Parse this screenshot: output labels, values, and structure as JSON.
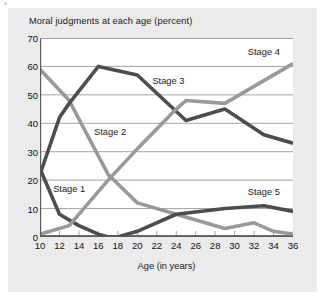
{
  "chart_data": {
    "type": "line",
    "title": "Moral judgments at each age (percent)",
    "xlabel": "Age (in years)",
    "ylabel": "",
    "xlim": [
      10,
      36
    ],
    "ylim": [
      0,
      70
    ],
    "grid": true,
    "legend_position": "inline-annotations",
    "xticks": [
      10,
      12,
      14,
      16,
      18,
      20,
      22,
      24,
      26,
      28,
      30,
      32,
      34,
      36
    ],
    "yticks": [
      0,
      10,
      20,
      30,
      40,
      50,
      60,
      70
    ],
    "x": [
      10,
      12,
      13,
      14,
      16,
      17,
      20,
      21,
      24,
      25,
      29,
      30,
      33,
      34,
      36
    ],
    "series": [
      {
        "name": "Stage 1",
        "color": "#4d4d4d",
        "points": [
          [
            10,
            24
          ],
          [
            12,
            8
          ],
          [
            14,
            4
          ],
          [
            16,
            1
          ],
          [
            17,
            0
          ],
          [
            36,
            0
          ]
        ]
      },
      {
        "name": "Stage 2",
        "color": "#999999",
        "points": [
          [
            10,
            59
          ],
          [
            13,
            48
          ],
          [
            17,
            22
          ],
          [
            20,
            12
          ],
          [
            24,
            8
          ],
          [
            29,
            3
          ],
          [
            32,
            5
          ],
          [
            34,
            2
          ],
          [
            36,
            1
          ]
        ]
      },
      {
        "name": "Stage 3",
        "color": "#4d4d4d",
        "points": [
          [
            10,
            22
          ],
          [
            12,
            42
          ],
          [
            13,
            47
          ],
          [
            16,
            60
          ],
          [
            20,
            57
          ],
          [
            25,
            41
          ],
          [
            29,
            45
          ],
          [
            33,
            36
          ],
          [
            36,
            33
          ]
        ]
      },
      {
        "name": "Stage 4",
        "color": "#999999",
        "points": [
          [
            10,
            1
          ],
          [
            13,
            4
          ],
          [
            17,
            20
          ],
          [
            20,
            31
          ],
          [
            24,
            45
          ],
          [
            25,
            48
          ],
          [
            29,
            47
          ],
          [
            36,
            61
          ]
        ]
      },
      {
        "name": "Stage 5",
        "color": "#4d4d4d",
        "points": [
          [
            10,
            0
          ],
          [
            18,
            0
          ],
          [
            20,
            2
          ],
          [
            24,
            8
          ],
          [
            29,
            10
          ],
          [
            33,
            11
          ],
          [
            36,
            9
          ]
        ]
      }
    ],
    "annotations": [
      {
        "text": "Stage 1",
        "x": 13.0,
        "y": 17.0
      },
      {
        "text": "Stage 2",
        "x": 17.2,
        "y": 37.0
      },
      {
        "text": "Stage 3",
        "x": 23.2,
        "y": 55.0
      },
      {
        "text": "Stage 4",
        "x": 33.0,
        "y": 65.0
      },
      {
        "text": "Stage 5",
        "x": 33.0,
        "y": 16.0
      }
    ],
    "colors": {
      "dark_series": "#4d4d4d",
      "light_series": "#999999",
      "background": "#ebebeb",
      "plot_background": "#ffffff",
      "gridline": "#9a9a9a",
      "axis": "#5a5a5a",
      "text": "#1a1a1a"
    }
  }
}
